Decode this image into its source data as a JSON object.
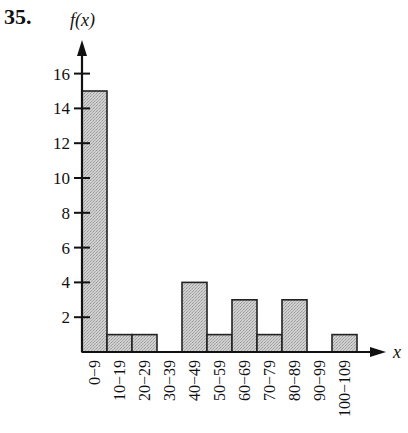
{
  "problem": {
    "number": "35."
  },
  "chart_data": {
    "type": "bar",
    "subtype": "histogram",
    "title": "",
    "xlabel": "x",
    "ylabel": "f(x)",
    "categories": [
      "0−9",
      "10−19",
      "20−29",
      "30−39",
      "40−49",
      "50−59",
      "60−69",
      "70−79",
      "80−89",
      "90−99",
      "100−109"
    ],
    "values": [
      15,
      1,
      1,
      0,
      4,
      1,
      3,
      1,
      3,
      0,
      1
    ],
    "ylim": [
      0,
      17
    ],
    "yticks": [
      2,
      4,
      6,
      8,
      10,
      12,
      14,
      16
    ],
    "grid": false,
    "legend": null,
    "bar_fill": "#c8c8c8",
    "bar_stroke": "#222222"
  }
}
